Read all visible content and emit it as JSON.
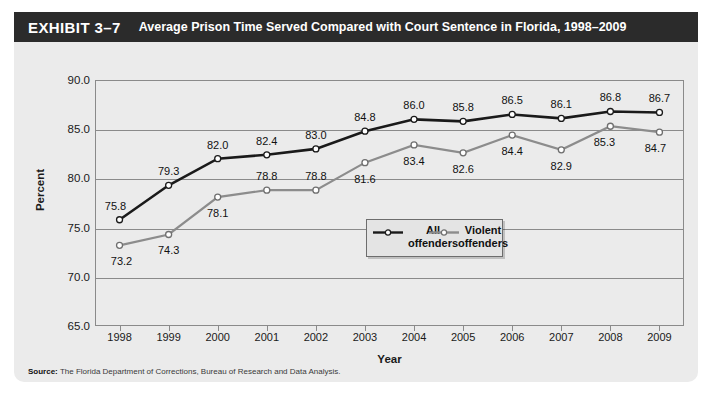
{
  "exhibit": {
    "number": "EXHIBIT 3–7",
    "title": "Average Prison Time Served Compared with Court Sentence in Florida, 1998–2009"
  },
  "source": {
    "label": "Source:",
    "text": "The Florida Department of Corrections, Bureau of Research and Data Analysis."
  },
  "legend": {
    "entry_all": "All\noffenders",
    "entry_all_line1": "All",
    "entry_all_line2": "offenders",
    "entry_violent_line1": "Violent",
    "entry_violent_line2": "offenders"
  },
  "colors": {
    "series_all": "#1a1a1a",
    "series_violent": "#8c8c8c",
    "marker_fill": "#ffffff",
    "axis": "#8a8a8a",
    "card_background": "#ebebeb",
    "header_background": "#2b2b2b",
    "header_text": "#ffffff"
  },
  "chart_data": {
    "type": "line",
    "title": "Average Prison Time Served Compared with Court Sentence in Florida, 1998–2009",
    "subtitle": "",
    "xlabel": "Year",
    "ylabel": "Percent",
    "categories": [
      "1998",
      "1999",
      "2000",
      "2001",
      "2002",
      "2003",
      "2004",
      "2005",
      "2006",
      "2007",
      "2008",
      "2009"
    ],
    "ylim": [
      65.0,
      90.0
    ],
    "ytick_labels": [
      "90.0",
      "85.0",
      "80.0",
      "75.0",
      "70.0",
      "65.0"
    ],
    "ytick_values": [
      90.0,
      85.0,
      80.0,
      75.0,
      70.0,
      65.0
    ],
    "grid": true,
    "legend_position": "center",
    "series": [
      {
        "name": "All offenders",
        "color": "#1a1a1a",
        "values": [
          75.8,
          79.3,
          82.0,
          82.4,
          83.0,
          84.8,
          86.0,
          85.8,
          86.5,
          86.1,
          86.8,
          86.7
        ],
        "labels": [
          "75.8",
          "79.3",
          "82.0",
          "82.4",
          "83.0",
          "84.8",
          "86.0",
          "85.8",
          "86.5",
          "86.1",
          "86.8",
          "86.7"
        ]
      },
      {
        "name": "Violent offenders",
        "color": "#8c8c8c",
        "values": [
          73.2,
          74.3,
          78.1,
          78.8,
          78.8,
          81.6,
          83.4,
          82.6,
          84.4,
          82.9,
          85.3,
          84.7
        ],
        "labels": [
          "73.2",
          "74.3",
          "78.1",
          "78.8",
          "78.8",
          "81.6",
          "83.4",
          "82.6",
          "84.4",
          "82.9",
          "85.3",
          "84.7"
        ]
      }
    ]
  }
}
